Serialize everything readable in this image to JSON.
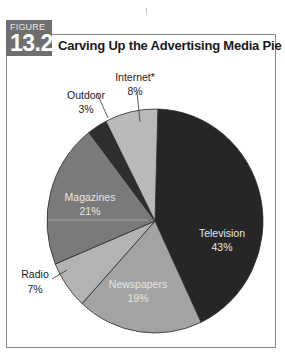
{
  "figure": {
    "label": "FIGURE",
    "number": "13.2",
    "title": "Carving Up the Advertising Media Pie",
    "badge_color": "#6f6f6f",
    "border_color": "#8a8a8a"
  },
  "chart_data": {
    "type": "pie",
    "title": "Carving Up the Advertising Media Pie",
    "categories": [
      "Television",
      "Newspapers",
      "Radio",
      "Magazines",
      "Outdoor",
      "Internet*"
    ],
    "values": [
      43,
      19,
      7,
      21,
      3,
      8
    ],
    "unit": "%",
    "colors": [
      "#262626",
      "#a3a3a3",
      "#b3b3b3",
      "#7a7a7a",
      "#2e2e2e",
      "#b9b9b9"
    ],
    "start_angle_deg": 0,
    "direction": "clockwise",
    "legend": "none (labels placed on/near slices)",
    "slices": [
      {
        "label": "Television",
        "value": "43%"
      },
      {
        "label": "Newspapers",
        "value": "19%"
      },
      {
        "label": "Radio",
        "value": "7%"
      },
      {
        "label": "Magazines",
        "value": "21%"
      },
      {
        "label": "Outdoor",
        "value": "3%"
      },
      {
        "label": "Internet*",
        "value": "8%"
      }
    ]
  }
}
